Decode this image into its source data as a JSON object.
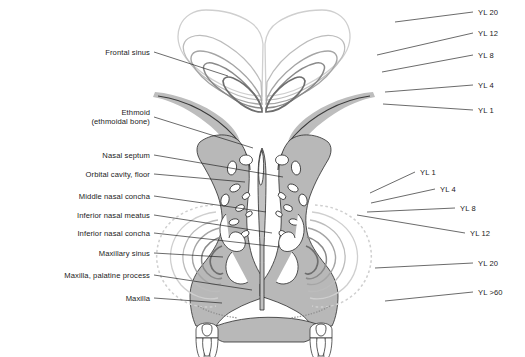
{
  "figure": {
    "background_color": "#ffffff",
    "line_color": "#1a1a1a",
    "bone_fill_color": "#b8b8b8",
    "cavity_color": "#ffffff"
  },
  "labels_left": [
    {
      "id": "frontal-sinus",
      "line1": "Frontal sinus",
      "line2": "",
      "x": 150,
      "y": 52,
      "tip_x": 228,
      "tip_y": 76
    },
    {
      "id": "ethmoid",
      "line1": "Ethmoid",
      "line2": "(ethmoidal bone)",
      "x": 150,
      "y": 117,
      "tip_x": 253,
      "tip_y": 148
    },
    {
      "id": "nasal-septum",
      "line1": "Nasal septum",
      "line2": "",
      "x": 150,
      "y": 155,
      "tip_x": 283,
      "tip_y": 177
    },
    {
      "id": "orbital-cavity-floor",
      "line1": "Orbital cavity, floor",
      "line2": "",
      "x": 150,
      "y": 174,
      "tip_x": 245,
      "tip_y": 182
    },
    {
      "id": "middle-nasal-concha",
      "line1": "Middle nasal concha",
      "line2": "",
      "x": 150,
      "y": 196,
      "tip_x": 266,
      "tip_y": 212
    },
    {
      "id": "inferior-nasal-meatus",
      "line1": "Inferior nasal meatus",
      "line2": "",
      "x": 150,
      "y": 215,
      "tip_x": 272,
      "tip_y": 233
    },
    {
      "id": "inferior-nasal-concha",
      "line1": "Inferior nasal concha",
      "line2": "",
      "x": 150,
      "y": 233,
      "tip_x": 279,
      "tip_y": 247
    },
    {
      "id": "maxillary-sinus",
      "line1": "Maxillary sinus",
      "line2": "",
      "x": 150,
      "y": 253,
      "tip_x": 223,
      "tip_y": 257
    },
    {
      "id": "maxilla-palatine-process",
      "line1": "Maxilla, palatine process",
      "line2": "",
      "x": 150,
      "y": 275,
      "tip_x": 252,
      "tip_y": 290
    },
    {
      "id": "maxilla",
      "line1": "Maxilla",
      "line2": "",
      "x": 150,
      "y": 298,
      "tip_x": 222,
      "tip_y": 303
    }
  ],
  "labels_right_upper": [
    {
      "id": "yl-20-frontal",
      "text": "YL 20",
      "x": 478,
      "y": 12,
      "tip_x": 395,
      "tip_y": 22
    },
    {
      "id": "yl-12-frontal",
      "text": "YL 12",
      "x": 478,
      "y": 33,
      "tip_x": 377,
      "tip_y": 55
    },
    {
      "id": "yl-8-frontal",
      "text": "YL 8",
      "x": 478,
      "y": 55,
      "tip_x": 382,
      "tip_y": 72
    },
    {
      "id": "yl-4-frontal",
      "text": "YL 4",
      "x": 478,
      "y": 85,
      "tip_x": 385,
      "tip_y": 92
    },
    {
      "id": "yl-1-frontal",
      "text": "YL 1",
      "x": 478,
      "y": 110,
      "tip_x": 383,
      "tip_y": 104
    }
  ],
  "labels_right_lower": [
    {
      "id": "yl-1-maxillary",
      "text": "YL 1",
      "x": 420,
      "y": 172,
      "tip_x": 370,
      "tip_y": 193
    },
    {
      "id": "yl-4-maxillary",
      "text": "YL 4",
      "x": 440,
      "y": 189,
      "tip_x": 371,
      "tip_y": 203
    },
    {
      "id": "yl-8-maxillary",
      "text": "YL 8",
      "x": 460,
      "y": 208,
      "tip_x": 367,
      "tip_y": 212
    },
    {
      "id": "yl-12-maxillary",
      "text": "YL 12",
      "x": 470,
      "y": 233,
      "tip_x": 357,
      "tip_y": 215
    },
    {
      "id": "yl-20-maxillary",
      "text": "YL 20",
      "x": 478,
      "y": 263,
      "tip_x": 375,
      "tip_y": 268
    },
    {
      "id": "yl-over-60",
      "text": "YL >60",
      "x": 478,
      "y": 292,
      "tip_x": 385,
      "tip_y": 301
    }
  ],
  "legend_meaning": {
    "YL": "year of life",
    "contour_series": [
      "YL 1",
      "YL 4",
      "YL 8",
      "YL 12",
      "YL 20",
      "YL >60"
    ]
  }
}
